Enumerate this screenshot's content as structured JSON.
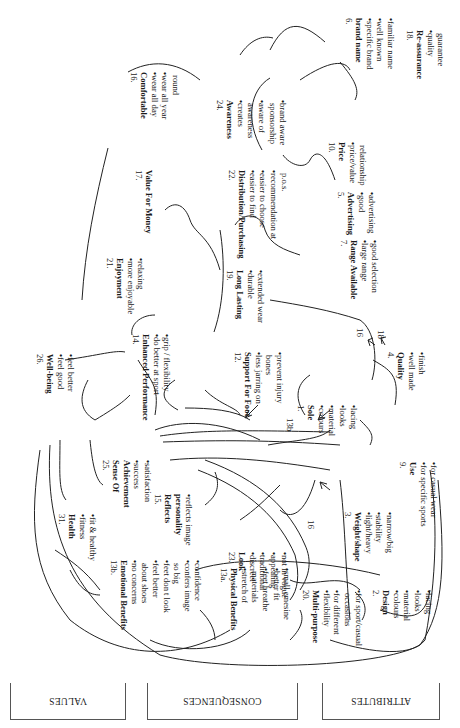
{
  "levels": {
    "values": "VALUES",
    "consequences": "CONSEQUENCES",
    "attributes": "ATTRIBUTES"
  },
  "nodes": {
    "n16": {
      "num": "16.",
      "title": "Comfortable",
      "items": [
        [
          "wear all day"
        ],
        [
          "wear all year",
          "round"
        ]
      ]
    },
    "n18": {
      "num": "18.",
      "title": "Re-assurance",
      "items": [
        [
          "quality",
          "guarantee"
        ]
      ]
    },
    "n6": {
      "num": "6.",
      "title": "brand name",
      "items": [
        [
          "specific brand"
        ],
        [
          "well known"
        ],
        [
          "familiar name"
        ]
      ]
    },
    "n24": {
      "num": "24.",
      "title": "Awareness",
      "items": [
        [
          "creates",
          "awareness"
        ],
        [
          "aware of",
          "sponsorship"
        ],
        [
          "brand aware"
        ]
      ]
    },
    "n10": {
      "num": "10.",
      "title": "Price",
      "items": [
        [
          "price/value",
          "relationship"
        ]
      ]
    },
    "n17": {
      "num": "17.",
      "title": "Value For Money",
      "items": []
    },
    "n22": {
      "num": "22.",
      "title": "Distribution/Purchasing",
      "items": [
        [
          "easier to find"
        ],
        [
          "easier  to choose"
        ],
        [
          "recommendation at",
          "p.o.s."
        ]
      ]
    },
    "n5": {
      "num": "5.",
      "title": "Advertising",
      "items": [
        [
          "good",
          "advertising"
        ]
      ]
    },
    "n21": {
      "num": "21.",
      "title": "Enjoyment",
      "items": [
        [
          "more enjoyable"
        ],
        [
          "relaxing"
        ]
      ]
    },
    "n19": {
      "num": "19.",
      "title": "Long Lasting",
      "items": [
        [
          "durable"
        ],
        [
          "extended wear"
        ]
      ]
    },
    "n7": {
      "num": "7.",
      "title": "Range Available",
      "items": [
        [
          "large range"
        ],
        [
          "good selection"
        ]
      ]
    },
    "n26": {
      "num": "26.",
      "title": "Well-being",
      "items": [
        [
          "feel good"
        ],
        [
          "feel better"
        ]
      ]
    },
    "n14": {
      "num": "14.",
      "title": "Enhanced Performance",
      "items": [
        [
          "do better at sport"
        ],
        [
          "grip / flexibility"
        ]
      ]
    },
    "n12": {
      "num": "12.",
      "title": "Support For Foot",
      "items": [
        [
          "less jarring on",
          "bones"
        ],
        [
          "prevent injury"
        ]
      ]
    },
    "n1": {
      "num": "1.",
      "title": "Sole",
      "items": [
        [
          "colours"
        ],
        [
          "material"
        ],
        [
          "looks"
        ],
        [
          "lacing"
        ]
      ]
    },
    "n4": {
      "num": "4.",
      "title": "Quality",
      "items": [
        [
          "well made"
        ],
        [
          "finish"
        ]
      ]
    },
    "n31": {
      "num": "31.",
      "title": "Health",
      "items": [
        [
          "fitness"
        ],
        [
          "fit & healthy"
        ]
      ]
    },
    "n25": {
      "num": "25.",
      "title": "Sense Of Achievement",
      "items": [
        [
          "success"
        ],
        [
          "satisfaction"
        ]
      ]
    },
    "n15": {
      "num": "15.",
      "title": "Reflects personality",
      "items": [
        [
          "reflects image"
        ]
      ]
    },
    "n23": {
      "num": "23.",
      "title": "Look",
      "items": [
        [
          "discreet"
        ],
        [
          "traditional"
        ],
        [
          "appealing"
        ],
        [
          "not in vogue"
        ]
      ]
    },
    "n3": {
      "num": "3.",
      "title": "Weight/shape",
      "items": [
        [
          "light/heavy"
        ],
        [
          "stability"
        ],
        [
          "narrow/big"
        ]
      ]
    },
    "n9": {
      "num": "9.",
      "title": "Use",
      "items": [
        [
          "for specific sports"
        ],
        [
          "for casual wear"
        ]
      ]
    },
    "n13b": {
      "num": "13b.",
      "title": "Emotional Benefits",
      "items": [
        [
          "no concerns",
          "about shoes"
        ],
        [
          "feel better"
        ],
        [
          "feet don t look",
          "so big"
        ],
        [
          "confers image"
        ],
        [
          "confidence"
        ]
      ]
    },
    "n13a": {
      "num": "13a.",
      "title": "Physical Benefits",
      "items": [
        [
          "stretch of",
          "materials"
        ],
        [
          "feet breathe"
        ],
        [
          "better fit"
        ],
        [
          "small emesine"
        ]
      ]
    },
    "n20": {
      "num": "20.",
      "title": "Multi-purpose",
      "items": [
        [
          "flexibility"
        ],
        [
          "for different",
          "occasions"
        ],
        [
          "for sport/casual"
        ]
      ]
    },
    "n2": {
      "num": "2.",
      "title": "Design",
      "items": [
        [
          "colours"
        ],
        [
          "material"
        ],
        [
          "looks"
        ],
        [
          "lacing"
        ]
      ]
    }
  },
  "annotations": {
    "a_13b": "13b",
    "a_16_top": "16",
    "a_18_top": "18",
    "a_16_mid": "16"
  },
  "bullet": "•"
}
